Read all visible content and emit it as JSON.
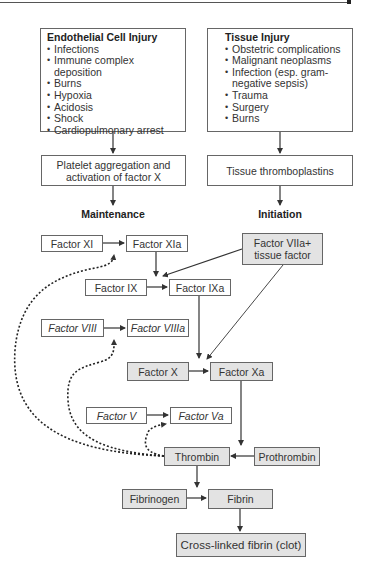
{
  "causes": {
    "endothelial": {
      "title": "Endothelial Cell Injury",
      "items": [
        "Infections",
        "Immune complex deposition",
        "Burns",
        "Hypoxia",
        "Acidosis",
        "Shock",
        "Cardiopulmonary arrest"
      ]
    },
    "tissue": {
      "title": "Tissue Injury",
      "items": [
        "Obstetric complications",
        "Malignant neoplasms",
        "Infection (esp. gram-negative sepsis)",
        "Trauma",
        "Surgery",
        "Burns"
      ]
    }
  },
  "mechanisms": {
    "platelet": "Platelet aggregation and activation of factor X",
    "thromboplastins": "Tissue thromboplastins"
  },
  "phases": {
    "maintenance": "Maintenance",
    "initiation": "Initiation"
  },
  "factors": {
    "xi": "Factor XI",
    "xia": "Factor XIa",
    "viia_tf": "Factor VIIa+ tissue factor",
    "ix": "Factor IX",
    "ixa": "Factor IXa",
    "viii": "Factor VIII",
    "viiia": "Factor VIIIa",
    "x": "Factor X",
    "xa": "Factor Xa",
    "v": "Factor V",
    "va": "Factor Va",
    "thrombin": "Thrombin",
    "prothrombin": "Prothrombin",
    "fibrinogen": "Fibrinogen",
    "fibrin": "Fibrin",
    "clot": "Cross-linked fibrin (clot)"
  },
  "colors": {
    "gray_box": "#e3e3e3",
    "border": "#666666",
    "line": "#333333"
  }
}
